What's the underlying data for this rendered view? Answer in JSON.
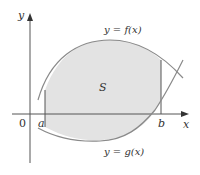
{
  "diagram": {
    "axes": {
      "x_label": "x",
      "y_label": "y",
      "origin_label": "0"
    },
    "bounds": {
      "left_label": "a",
      "right_label": "b"
    },
    "curves": {
      "upper_label": "y = f(x)",
      "lower_label": "y = g(x)"
    },
    "region_label": "S",
    "colors": {
      "region_fill": "#e3e3e3",
      "curve_stroke": "#8a8a8a",
      "axis_stroke": "#555555",
      "text": "#333333"
    }
  }
}
